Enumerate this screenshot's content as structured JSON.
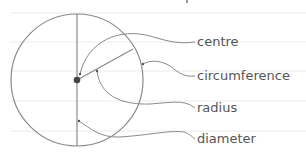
{
  "diagram": {
    "type": "labelled circle diagram",
    "labels": {
      "centre": "centre",
      "circumference": "circumference",
      "radius": "radius",
      "diameter": "diameter"
    },
    "colors": {
      "stroke": "#8a8a8a",
      "centre_dot": "#444444",
      "ruled_line": "#eeeeee",
      "text": "#555555"
    }
  }
}
